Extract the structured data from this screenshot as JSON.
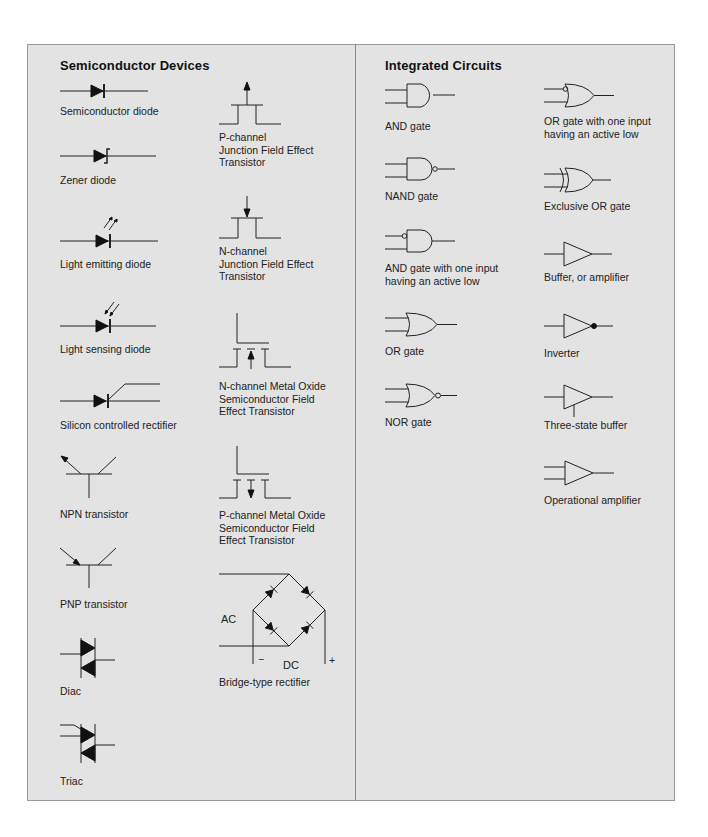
{
  "sections": {
    "semiconductor": {
      "title": "Semiconductor Devices",
      "items": [
        {
          "label": "Semiconductor diode",
          "icon": "diode-icon"
        },
        {
          "label": "Zener diode",
          "icon": "zener-diode-icon"
        },
        {
          "label": "Light emitting diode",
          "icon": "led-icon"
        },
        {
          "label": "Light sensing diode",
          "icon": "photodiode-icon"
        },
        {
          "label": "Silicon controlled rectifier",
          "icon": "scr-icon"
        },
        {
          "label": "NPN transistor",
          "icon": "npn-transistor-icon"
        },
        {
          "label": "PNP transistor",
          "icon": "pnp-transistor-icon"
        },
        {
          "label": "Diac",
          "icon": "diac-icon"
        },
        {
          "label": "Triac",
          "icon": "triac-icon"
        },
        {
          "label": "P-channel\nJunction Field Effect\nTransistor",
          "icon": "p-channel-jfet-icon"
        },
        {
          "label": "N-channel\nJunction Field Effect\nTransistor",
          "icon": "n-channel-jfet-icon"
        },
        {
          "label": "N-channel Metal Oxide\nSemiconductor Field\nEffect Transistor",
          "icon": "n-channel-mosfet-icon"
        },
        {
          "label": "P-channel Metal Oxide\nSemiconductor Field\nEffect Transistor",
          "icon": "p-channel-mosfet-icon"
        },
        {
          "label": "Bridge-type rectifier",
          "icon": "bridge-rectifier-icon"
        }
      ],
      "bridge_labels": {
        "ac": "AC",
        "dc": "DC",
        "minus": "−",
        "plus": "+"
      }
    },
    "integrated": {
      "title": "Integrated Circuits",
      "items": [
        {
          "label": "AND gate",
          "icon": "and-gate-icon"
        },
        {
          "label": "NAND gate",
          "icon": "nand-gate-icon"
        },
        {
          "label": "AND gate with one input\nhaving an active low",
          "icon": "and-gate-active-low-icon"
        },
        {
          "label": "OR gate",
          "icon": "or-gate-icon"
        },
        {
          "label": "NOR gate",
          "icon": "nor-gate-icon"
        },
        {
          "label": "OR gate with one input\nhaving an active low",
          "icon": "or-gate-active-low-icon"
        },
        {
          "label": "Exclusive OR gate",
          "icon": "xor-gate-icon"
        },
        {
          "label": "Buffer, or amplifier",
          "icon": "buffer-icon"
        },
        {
          "label": "Inverter",
          "icon": "inverter-icon"
        },
        {
          "label": "Three-state buffer",
          "icon": "three-state-buffer-icon"
        },
        {
          "label": "Operational amplifier",
          "icon": "op-amp-icon"
        }
      ]
    }
  },
  "colors": {
    "panel": "#e3e3e3",
    "border": "#9a9a9a",
    "ink": "#1a1a1a"
  }
}
